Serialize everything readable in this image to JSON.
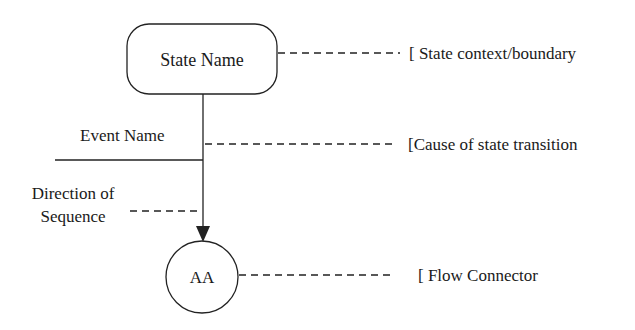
{
  "diagram": {
    "state": {
      "label": "State Name"
    },
    "event": {
      "label": "Event Name"
    },
    "direction": {
      "line1": "Direction of",
      "line2": "Sequence"
    },
    "connector": {
      "label": "AA"
    },
    "annotations": {
      "state_context": "[ State context/boundary",
      "cause": "[Cause of state transition",
      "flow_connector": "[ Flow Connector"
    },
    "colors": {
      "stroke": "#222222",
      "text": "#1a1a1a",
      "background": "#ffffff"
    }
  }
}
